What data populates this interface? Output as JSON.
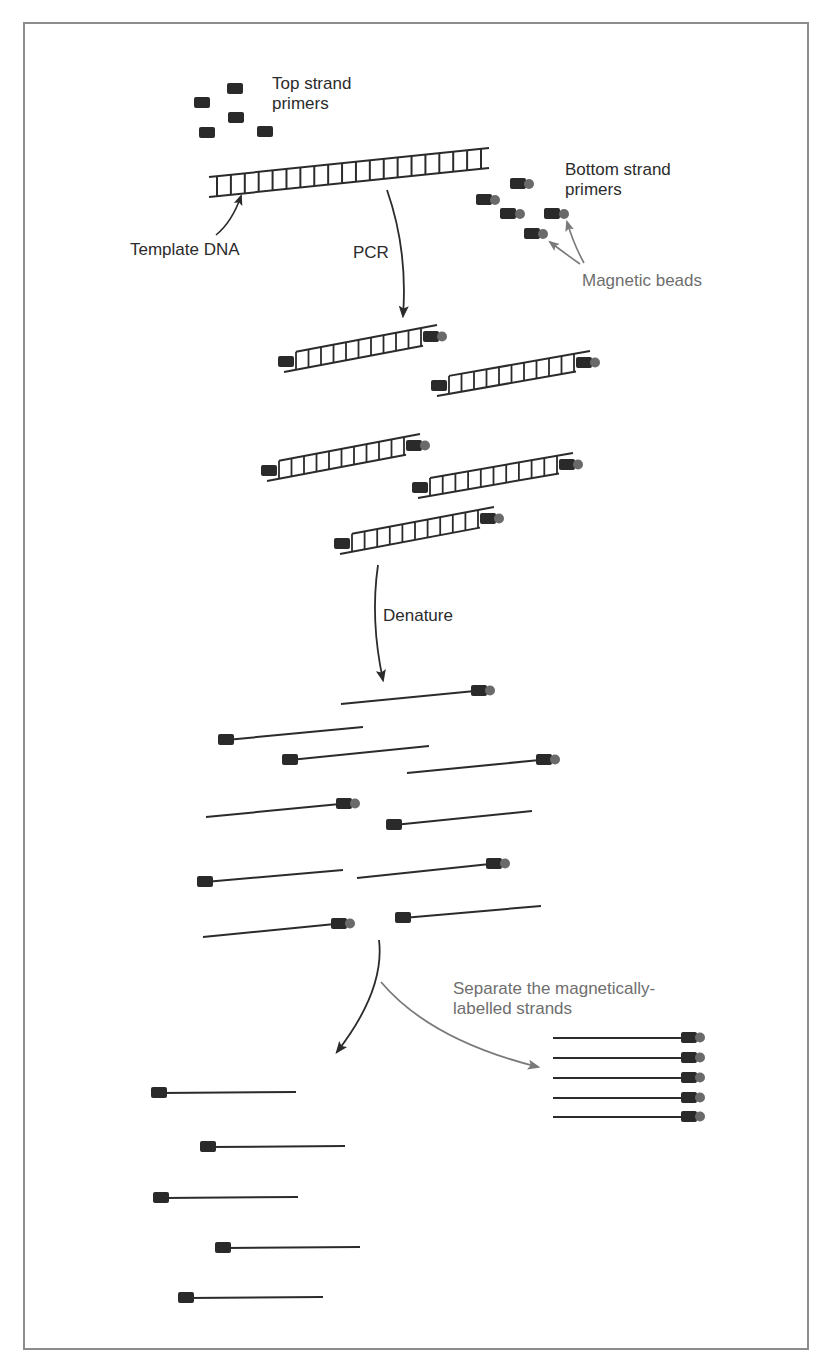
{
  "figure": {
    "type": "process-diagram"
  },
  "labels": {
    "top_primers": [
      "Top strand",
      "primers"
    ],
    "bottom_primers": [
      "Bottom strand",
      "primers"
    ],
    "template": "Template DNA",
    "pcr": "PCR",
    "magnetic_beads": "Magnetic beads",
    "denature": "Denature",
    "separate": [
      "Separate the magnetically-",
      "labelled strands"
    ]
  },
  "colors": {
    "frame": "#8c8c8c",
    "strand": "#2b2b2b",
    "primer": "#2a2a2a",
    "bead": "#6a6a6a",
    "gray_arrow": "#7a7a7a",
    "label_dark": "#2b2b2b",
    "label_gray": "#6e6e6e"
  },
  "stages": [
    {
      "name": "reactants",
      "items": [
        "5 top strand primers",
        "5 bottom strand primers with magnetic beads",
        "template DNA ladder"
      ]
    },
    {
      "name": "pcr_products",
      "count": 5,
      "description": "double-stranded products with top primer on left and bead-labelled bottom primer on right"
    },
    {
      "name": "denatured_strands",
      "count": 10,
      "bead_labelled": 5,
      "unlabelled": 5
    },
    {
      "name": "separated_magnetic",
      "count": 5
    },
    {
      "name": "separated_unlabelled",
      "count": 5
    }
  ]
}
